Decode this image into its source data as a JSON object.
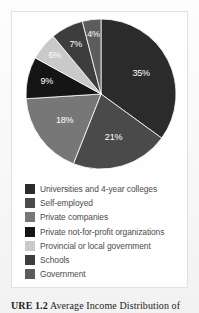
{
  "figure": {
    "caption_label": "URE 1.2",
    "caption_rest": "  Average Income Distribution of"
  },
  "chart_data": {
    "type": "pie",
    "title": "",
    "categories": [
      "Universities and 4-year colleges",
      "Self-employed",
      "Private companies",
      "Private not-for-profit organizations",
      "Provincial or local government",
      "Schools",
      "Government"
    ],
    "values": [
      35,
      21,
      18,
      9,
      6,
      7,
      4
    ],
    "value_labels": [
      "35%",
      "21%",
      "18%",
      "9%",
      "6%",
      "7%",
      "4%"
    ],
    "colors": [
      "#2b2b2b",
      "#4a4a4a",
      "#777777",
      "#151515",
      "#c9c9c9",
      "#3d3d3d",
      "#5c5c5c"
    ],
    "start_angle_deg": 0,
    "direction": "clockwise",
    "legend_position": "bottom",
    "grid": false,
    "units": "percent"
  },
  "legend": {
    "items": [
      {
        "label": "Universities and 4-year colleges",
        "color": "#2b2b2b",
        "value": "35%"
      },
      {
        "label": "Self-employed",
        "color": "#4a4a4a",
        "value": "21%"
      },
      {
        "label": "Private companies",
        "color": "#777777",
        "value": "18%"
      },
      {
        "label": "Private not-for-profit organizations",
        "color": "#151515",
        "value": "9%"
      },
      {
        "label": "Provincial or local government",
        "color": "#c9c9c9",
        "value": "6%"
      },
      {
        "label": "Schools",
        "color": "#3d3d3d",
        "value": "7%"
      },
      {
        "label": "Government",
        "color": "#5c5c5c",
        "value": "4%"
      }
    ]
  }
}
